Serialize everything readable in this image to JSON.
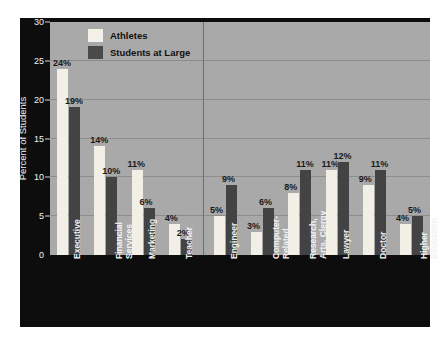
{
  "chart_data": {
    "type": "bar",
    "title": "",
    "xlabel": "",
    "ylabel": "Percent of Students",
    "ylim": [
      0,
      30
    ],
    "yticks": [
      0,
      5,
      10,
      15,
      20,
      25,
      30
    ],
    "grid": true,
    "legend_position": "top-left-inside",
    "categories": [
      "Executive",
      "Financial Services",
      "Marketing",
      "Teacher",
      "Engineer",
      "Computer-Related",
      "Research, Arts, Clergy",
      "Lawyer",
      "Doctor",
      "Higher Education"
    ],
    "category_label_lines": [
      [
        "Executive"
      ],
      [
        "Financial",
        "Services"
      ],
      [
        "Marketing"
      ],
      [
        "Teacher"
      ],
      [
        "Engineer"
      ],
      [
        "Computer-",
        "Related"
      ],
      [
        "Research,",
        "Arts, Clergy"
      ],
      [
        "Lawyer"
      ],
      [
        "Doctor"
      ],
      [
        "Higher",
        "Education"
      ]
    ],
    "series": [
      {
        "name": "Athletes",
        "color": "#f2efe6",
        "values": [
          24,
          14,
          11,
          4,
          5,
          3,
          8,
          11,
          9,
          4
        ]
      },
      {
        "name": "Students at Large",
        "color": "#434343",
        "values": [
          19,
          10,
          6,
          2,
          9,
          6,
          11,
          12,
          11,
          5
        ]
      }
    ],
    "value_labels": [
      [
        "24%",
        "19%"
      ],
      [
        "14%",
        "10%"
      ],
      [
        "11%",
        "6%"
      ],
      [
        "4%",
        "2%"
      ],
      [
        "5%",
        "9%"
      ],
      [
        "3%",
        "6%"
      ],
      [
        "8%",
        "11%"
      ],
      [
        "11%",
        "12%"
      ],
      [
        "9%",
        "11%"
      ],
      [
        "4%",
        "5%"
      ]
    ],
    "group_divider_after_category_index": 3,
    "annotations": []
  },
  "legend": {
    "items": [
      {
        "label": "Athletes"
      },
      {
        "label": "Students at Large"
      }
    ]
  },
  "axis": {
    "y_title": "Percent of Students",
    "y_tick_labels": [
      "0",
      "5",
      "10",
      "15",
      "20",
      "25",
      "30"
    ]
  },
  "colors": {
    "plot_background": "#a9a9a9",
    "frame": "#0d0d0d",
    "gridline": "#8d8d8d",
    "athletes_bar": "#f2efe6",
    "students_bar": "#434343",
    "axis_text": "#f2f2f2",
    "value_text": "#1a1a1a"
  }
}
